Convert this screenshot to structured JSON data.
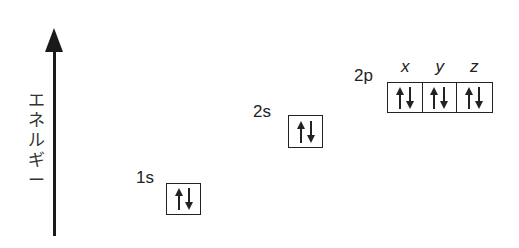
{
  "diagram": {
    "axis": {
      "label": "エネルギー",
      "label_chars": [
        "エ",
        "ネ",
        "ル",
        "ギ",
        "ー"
      ],
      "direction": "up"
    },
    "orbitals": [
      {
        "name": "1s",
        "electrons": [
          "up",
          "down"
        ]
      },
      {
        "name": "2s",
        "electrons": [
          "up",
          "down"
        ]
      },
      {
        "name": "2p",
        "suborbitals": [
          {
            "label": "x",
            "electrons": [
              "up",
              "down"
            ]
          },
          {
            "label": "y",
            "electrons": [
              "up",
              "down"
            ]
          },
          {
            "label": "z",
            "electrons": [
              "up",
              "down"
            ]
          }
        ]
      }
    ]
  }
}
